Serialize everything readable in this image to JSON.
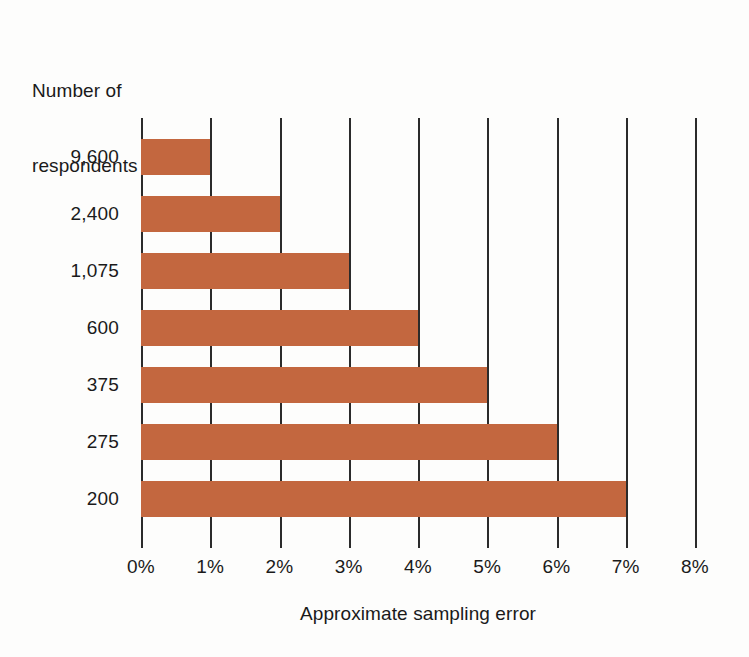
{
  "chart_data": {
    "type": "bar",
    "orientation": "horizontal",
    "title": "",
    "ylabel": "Number of respondents",
    "xlabel": "Approximate sampling error",
    "categories": [
      "9,600",
      "2,400",
      "1,075",
      "600",
      "375",
      "275",
      "200"
    ],
    "values": [
      1,
      2,
      3,
      4,
      5,
      6,
      7
    ],
    "value_labels": [
      "1%",
      "2%",
      "3%",
      "4%",
      "5%",
      "6%",
      "7%"
    ],
    "xlim": [
      0,
      8
    ],
    "xticks": [
      0,
      1,
      2,
      3,
      4,
      5,
      6,
      7,
      8
    ],
    "xticklabels": [
      "0%",
      "1%",
      "2%",
      "3%",
      "4%",
      "5%",
      "6%",
      "7%",
      "8%"
    ],
    "grid": "vertical",
    "legend": "none",
    "series": [
      {
        "name": "Approximate sampling error",
        "values": [
          1,
          2,
          3,
          4,
          5,
          6,
          7
        ]
      }
    ]
  },
  "colors": {
    "bar": "#c3673f",
    "gridline": "#2b2b2b",
    "text": "#1a1a1a",
    "background": "#fdfdfc"
  },
  "y_axis_title_lines": [
    "Number of",
    "respondents"
  ]
}
